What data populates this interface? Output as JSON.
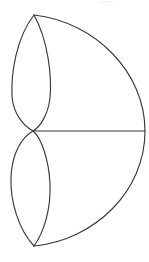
{
  "figure": {
    "title": "Semicircle with two inscribed lens shapes",
    "caption": "",
    "background_color": "#ffffff",
    "stroke_color": "#3a3a3c",
    "stroke_width": 1.15,
    "canvas": {
      "width": 149,
      "height": 262
    },
    "points": {
      "top_vertex": {
        "x": 34,
        "y": 15
      },
      "center_vertex": {
        "x": 33,
        "y": 131
      },
      "bottom_vertex": {
        "x": 34,
        "y": 246
      },
      "right_vertex": {
        "x": 145,
        "y": 131
      },
      "upper_lens_left_extent": {
        "x": 11,
        "y": 73
      },
      "upper_lens_right_extent": {
        "x": 51,
        "y": 73
      },
      "lower_lens_left_extent": {
        "x": 11,
        "y": 188
      },
      "lower_lens_right_extent": {
        "x": 50,
        "y": 188
      }
    },
    "paths": {
      "outer_arc": "M 34 15 C 95 22 145 72 145 131 C 145 191 95 240 34 246",
      "upper_lens_left": "M 34 15 C 16 38 11 74 12 96 C 13 114 24 126 33 131",
      "upper_lens_right": "M 34 15 C 48 40 52 76 50 98 C 48 115 40 127 33 131",
      "lower_lens_left": "M 33 131 C 22 137 12 153 11 177 C 10 202 19 230 34 246",
      "lower_lens_right": "M 33 131 C 41 137 49 160 50 184 C 51 209 44 232 34 246",
      "radius_line": "M 33 131 L 145 131",
      "faint_mark": "M 99 3 C 104 1 110 1 114 3"
    },
    "elements": [
      {
        "name": "outer-arc",
        "label": "Outer semicircular arc"
      },
      {
        "name": "upper-lens-left-arc",
        "label": "Upper lens left arc"
      },
      {
        "name": "upper-lens-right-arc",
        "label": "Upper lens right arc"
      },
      {
        "name": "lower-lens-left-arc",
        "label": "Lower lens left arc"
      },
      {
        "name": "lower-lens-right-arc",
        "label": "Lower lens right arc"
      },
      {
        "name": "horizontal-radius-line",
        "label": "Horizontal radius line"
      }
    ]
  }
}
